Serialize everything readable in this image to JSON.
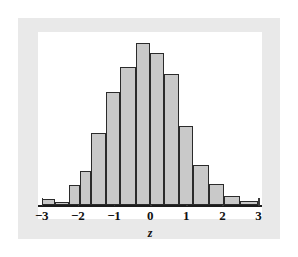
{
  "figure": {
    "background_color": "#ffffff",
    "mat_color": "#e9e9e9",
    "card_color": "#ffffff",
    "bar_fill": "#c9c9c9",
    "bar_stroke": "#2b2b2b",
    "axis_color": "#1c1c1c"
  },
  "chart_data": {
    "type": "bar",
    "title": "",
    "subtitle": "",
    "xlabel": "z",
    "ylabel": "",
    "grid": false,
    "legend": null,
    "xlim": [
      -3.1,
      3.1
    ],
    "ylim": [
      0,
      1.0
    ],
    "bin_width": 0.4,
    "categories": [
      "-3.0 to -2.6",
      "-2.6 to -2.2",
      "-2.2 to -1.8",
      "-1.8 to -1.4",
      "-1.4 to -1.0",
      "-1.0 to -0.6",
      "-0.6 to -0.2",
      "-0.2 to 0.2",
      "0.2 to 0.6",
      "0.6 to 1.0",
      "1.0 to 1.4",
      "1.4 to 1.8",
      "1.8 to 2.2",
      "2.2 to 2.6",
      "2.6 to 3.0"
    ],
    "bins": [
      {
        "left": -3.0,
        "right": -2.62,
        "value": 0.035
      },
      {
        "left": -2.62,
        "right": -2.25,
        "value": 0.018
      },
      {
        "left": -2.25,
        "right": -1.95,
        "value": 0.115
      },
      {
        "left": -1.95,
        "right": -1.62,
        "value": 0.195
      },
      {
        "left": -1.62,
        "right": -1.22,
        "value": 0.415
      },
      {
        "left": -1.22,
        "right": -0.82,
        "value": 0.655
      },
      {
        "left": -0.82,
        "right": -0.4,
        "value": 0.795
      },
      {
        "left": -0.4,
        "right": 0.0,
        "value": 0.935
      },
      {
        "left": 0.0,
        "right": 0.4,
        "value": 0.88
      },
      {
        "left": 0.4,
        "right": 0.8,
        "value": 0.755
      },
      {
        "left": 0.8,
        "right": 1.2,
        "value": 0.455
      },
      {
        "left": 1.2,
        "right": 1.62,
        "value": 0.23
      },
      {
        "left": 1.62,
        "right": 2.05,
        "value": 0.12
      },
      {
        "left": 2.05,
        "right": 2.5,
        "value": 0.055
      },
      {
        "left": 2.5,
        "right": 3.0,
        "value": 0.025
      }
    ],
    "values": [
      0.035,
      0.018,
      0.115,
      0.195,
      0.415,
      0.655,
      0.795,
      0.935,
      0.88,
      0.755,
      0.455,
      0.23,
      0.12,
      0.055,
      0.025
    ],
    "xticks": [
      -3,
      -2,
      -1,
      0,
      1,
      2,
      3
    ],
    "xtick_labels": [
      "−3",
      "−2",
      "−1",
      "0",
      "1",
      "2",
      "3"
    ]
  }
}
